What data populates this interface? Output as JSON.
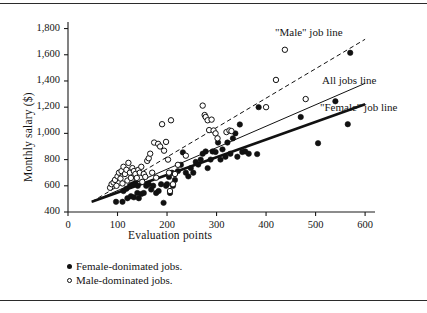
{
  "chart_data": {
    "type": "scatter",
    "title": "",
    "xlabel": "Evaluation points",
    "ylabel": "Monthly salary ($)",
    "xlim": [
      0,
      620
    ],
    "ylim": [
      400,
      1850
    ],
    "xticks": [
      0,
      100,
      200,
      300,
      400,
      500,
      600
    ],
    "xtick_labels": [
      "0",
      "100",
      "200",
      "300",
      "400",
      "500",
      "600"
    ],
    "yticks": [
      400,
      600,
      800,
      1000,
      1200,
      1400,
      1600,
      1800
    ],
    "ytick_labels": [
      "400",
      "600",
      "800",
      "1,000",
      "1,200",
      "1,400",
      "1,600",
      "1,800"
    ],
    "grid": false,
    "legend_position": "below-axes",
    "series": [
      {
        "name": "Female-donimated jobs.",
        "marker": "filled-circle",
        "color": "#111111",
        "points": [
          [
            97,
            478
          ],
          [
            110,
            478
          ],
          [
            120,
            505
          ],
          [
            127,
            520
          ],
          [
            133,
            512
          ],
          [
            140,
            545
          ],
          [
            143,
            505
          ],
          [
            112,
            560
          ],
          [
            118,
            578
          ],
          [
            125,
            598
          ],
          [
            130,
            610
          ],
          [
            136,
            622
          ],
          [
            141,
            600
          ],
          [
            148,
            538
          ],
          [
            153,
            545
          ],
          [
            158,
            600
          ],
          [
            163,
            612
          ],
          [
            168,
            572
          ],
          [
            172,
            600
          ],
          [
            178,
            545
          ],
          [
            183,
            560
          ],
          [
            188,
            612
          ],
          [
            193,
            470
          ],
          [
            198,
            600
          ],
          [
            200,
            612
          ],
          [
            206,
            545
          ],
          [
            212,
            600
          ],
          [
            204,
            668
          ],
          [
            210,
            700
          ],
          [
            216,
            645
          ],
          [
            222,
            712
          ],
          [
            228,
            760
          ],
          [
            232,
            855
          ],
          [
            238,
            700
          ],
          [
            243,
            672
          ],
          [
            248,
            735
          ],
          [
            253,
            700
          ],
          [
            258,
            782
          ],
          [
            263,
            762
          ],
          [
            268,
            800
          ],
          [
            272,
            845
          ],
          [
            278,
            862
          ],
          [
            282,
            735
          ],
          [
            288,
            800
          ],
          [
            292,
            862
          ],
          [
            298,
            858
          ],
          [
            303,
            930
          ],
          [
            308,
            800
          ],
          [
            312,
            878
          ],
          [
            318,
            822
          ],
          [
            322,
            930
          ],
          [
            328,
            845
          ],
          [
            333,
            962
          ],
          [
            338,
            1000
          ],
          [
            342,
            822
          ],
          [
            347,
            1068
          ],
          [
            352,
            858
          ],
          [
            358,
            862
          ],
          [
            365,
            845
          ],
          [
            382,
            842
          ],
          [
            385,
            1200
          ],
          [
            470,
            1125
          ],
          [
            505,
            925
          ],
          [
            540,
            1245
          ],
          [
            565,
            1070
          ],
          [
            570,
            1615
          ]
        ]
      },
      {
        "name": "Male-dominated jobs.",
        "marker": "open-circle",
        "color": "#111111",
        "points": [
          [
            85,
            585
          ],
          [
            88,
            612
          ],
          [
            92,
            625
          ],
          [
            95,
            645
          ],
          [
            98,
            600
          ],
          [
            100,
            672
          ],
          [
            103,
            700
          ],
          [
            106,
            655
          ],
          [
            108,
            712
          ],
          [
            110,
            618
          ],
          [
            112,
            745
          ],
          [
            115,
            690
          ],
          [
            118,
            722
          ],
          [
            120,
            640
          ],
          [
            122,
            775
          ],
          [
            125,
            700
          ],
          [
            127,
            660
          ],
          [
            130,
            735
          ],
          [
            133,
            712
          ],
          [
            136,
            690
          ],
          [
            139,
            660
          ],
          [
            142,
            722
          ],
          [
            145,
            700
          ],
          [
            148,
            745
          ],
          [
            150,
            630
          ],
          [
            153,
            690
          ],
          [
            156,
            668
          ],
          [
            160,
            790
          ],
          [
            163,
            810
          ],
          [
            166,
            845
          ],
          [
            170,
            700
          ],
          [
            174,
            930
          ],
          [
            178,
            662
          ],
          [
            182,
            920
          ],
          [
            186,
            900
          ],
          [
            190,
            1070
          ],
          [
            194,
            868
          ],
          [
            198,
            935
          ],
          [
            202,
            800
          ],
          [
            204,
            700
          ],
          [
            208,
            1100
          ],
          [
            212,
            612
          ],
          [
            206,
            560
          ],
          [
            216,
            690
          ],
          [
            222,
            760
          ],
          [
            238,
            830
          ],
          [
            272,
            1212
          ],
          [
            276,
            1140
          ],
          [
            278,
            1125
          ],
          [
            282,
            1100
          ],
          [
            285,
            1025
          ],
          [
            290,
            1105
          ],
          [
            294,
            1022
          ],
          [
            298,
            1000
          ],
          [
            302,
            962
          ],
          [
            320,
            1010
          ],
          [
            326,
            1022
          ],
          [
            330,
            1018
          ],
          [
            400,
            1200
          ],
          [
            420,
            1408
          ],
          [
            438,
            1638
          ],
          [
            480,
            1262
          ]
        ]
      }
    ],
    "trend_lines": [
      {
        "name": "\"Male\" job line",
        "style": "dashed",
        "width": 1.0,
        "x0": 48,
        "y0": 478,
        "x1": 600,
        "y1": 1718
      },
      {
        "name": "All jobs line",
        "style": "solid",
        "width": 1.0,
        "x0": 48,
        "y0": 478,
        "x1": 600,
        "y1": 1382
      },
      {
        "name": "\"Female\" job line",
        "style": "solid",
        "width": 2.6,
        "x0": 48,
        "y0": 478,
        "x1": 600,
        "y1": 1222
      }
    ],
    "annotations": [
      {
        "text": "\"Male\" job line",
        "x_px": 275,
        "y_px": 26
      },
      {
        "text": "All jobs line",
        "x_px": 322,
        "y_px": 74
      },
      {
        "text": "\"Female\" job line",
        "x_px": 320,
        "y_px": 101
      }
    ],
    "legend_entries": [
      {
        "marker": "filled-circle",
        "label": "Female-donimated jobs."
      },
      {
        "marker": "open-circle",
        "label": "Male-dominated jobs."
      }
    ]
  }
}
